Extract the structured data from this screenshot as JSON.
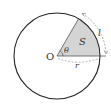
{
  "figure": {
    "labels": {
      "center": "O",
      "angle": "θ",
      "area": "S",
      "arc_length": "l",
      "radius": "r"
    },
    "colors": {
      "stroke": "#222222",
      "sector_fill": "#d4d4d4",
      "dimension": "#888888",
      "text": "#333333"
    }
  }
}
